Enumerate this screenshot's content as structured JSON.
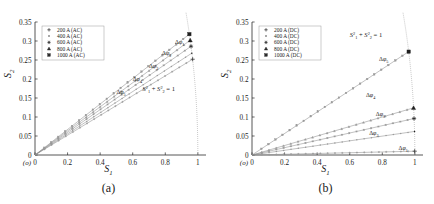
{
  "figure": {
    "panels": [
      {
        "id": "a",
        "caption": "(a)",
        "origin_label": "(o)",
        "xlabel": "S1",
        "ylabel": "S2",
        "circle_annotation": "S1^2 + S2^2 = 1",
        "legend": [
          {
            "label": "200 A (AC)",
            "marker": "plus"
          },
          {
            "label": "400 A (AC)",
            "marker": "dot"
          },
          {
            "label": "600 A (AC)",
            "marker": "star"
          },
          {
            "label": "800 A (AC)",
            "marker": "tri"
          },
          {
            "label": "1000 A (AC)",
            "marker": "square"
          }
        ],
        "phase_labels": [
          "d1",
          "d2",
          "d3",
          "d4",
          "d5"
        ]
      },
      {
        "id": "b",
        "caption": "(b)",
        "origin_label": "(o)",
        "xlabel": "S1",
        "ylabel": "S2",
        "circle_annotation": "S1^2 + S2^2 = 1",
        "legend": [
          {
            "label": "200 A (DC)",
            "marker": "plus"
          },
          {
            "label": "400 A (DC)",
            "marker": "dot"
          },
          {
            "label": "600 A (DC)",
            "marker": "star"
          },
          {
            "label": "800 A (DC)",
            "marker": "tri"
          },
          {
            "label": "1000 A (DC)",
            "marker": "square"
          }
        ],
        "phase_labels": [
          "d1",
          "d2",
          "d3",
          "d4",
          "d5"
        ]
      }
    ]
  },
  "chart_data": [
    {
      "type": "scatter",
      "panel": "a",
      "title": "",
      "xlabel": "S₁",
      "ylabel": "S₂",
      "xlim": [
        0,
        1.05
      ],
      "ylim": [
        0,
        0.35
      ],
      "xticks": [
        0,
        0.2,
        0.4,
        0.6,
        0.8,
        1
      ],
      "xticklabels": [
        "0",
        "0.2",
        "0.4",
        "0.6",
        "0.8",
        "1"
      ],
      "yticks": [
        0,
        0.05,
        0.1,
        0.15,
        0.2,
        0.25,
        0.3,
        0.35
      ],
      "yticklabels": [
        "0",
        "0.05",
        "0.1",
        "0.15",
        "0.2",
        "0.25",
        "0.3",
        "0.35"
      ],
      "grid": false,
      "legend_position": "upper-left",
      "annotations": [
        {
          "text": "S₁² + S₂² = 1",
          "x": 0.66,
          "y": 0.168
        },
        {
          "text": "Δφ₁",
          "x": 0.86,
          "y": 0.292
        },
        {
          "text": "Δφ₂",
          "x": 0.78,
          "y": 0.262
        },
        {
          "text": "Δφ₃",
          "x": 0.7,
          "y": 0.228
        },
        {
          "text": "Δφ₄",
          "x": 0.6,
          "y": 0.196
        },
        {
          "text": "Δφ₅",
          "x": 0.5,
          "y": 0.16
        }
      ],
      "arc": {
        "label": "unit circle",
        "radius": 1,
        "theta_deg": [
          14,
          19
        ]
      },
      "series": [
        {
          "name": "200 A (AC)",
          "marker": "plus",
          "endpoint": [
            0.968,
            0.252
          ]
        },
        {
          "name": "400 A (AC)",
          "marker": "dot",
          "endpoint": [
            0.963,
            0.268
          ]
        },
        {
          "name": "600 A (AC)",
          "marker": "star",
          "endpoint": [
            0.958,
            0.286
          ]
        },
        {
          "name": "800 A (AC)",
          "marker": "tri",
          "endpoint": [
            0.953,
            0.302
          ]
        },
        {
          "name": "1000 A (AC)",
          "marker": "square",
          "endpoint": [
            0.948,
            0.318
          ]
        }
      ]
    },
    {
      "type": "scatter",
      "panel": "b",
      "title": "",
      "xlabel": "S₁",
      "ylabel": "S₂",
      "xlim": [
        0,
        1.05
      ],
      "ylim": [
        0,
        0.35
      ],
      "xticks": [
        0,
        0.2,
        0.4,
        0.6,
        0.8,
        1
      ],
      "xticklabels": [
        "0",
        "0.2",
        "0.4",
        "0.6",
        "0.8",
        "1"
      ],
      "yticks": [
        0,
        0.05,
        0.1,
        0.15,
        0.2,
        0.25,
        0.3,
        0.35
      ],
      "yticklabels": [
        "0",
        "0.05",
        "0.1",
        "0.15",
        "0.2",
        "0.25",
        "0.3",
        "0.35"
      ],
      "grid": false,
      "legend_position": "upper-left",
      "annotations": [
        {
          "text": "S₁² + S₂² = 1",
          "x": 0.6,
          "y": 0.31
        },
        {
          "text": "Δφ₅",
          "x": 0.78,
          "y": 0.248
        },
        {
          "text": "Δφ₄",
          "x": 0.7,
          "y": 0.152
        },
        {
          "text": "Δφ₃",
          "x": 0.76,
          "y": 0.103
        },
        {
          "text": "Δφ₂",
          "x": 0.72,
          "y": 0.052
        },
        {
          "text": "Δφ₁",
          "x": 0.9,
          "y": 0.013
        }
      ],
      "arc": {
        "label": "unit circle",
        "radius": 1,
        "theta_deg": [
          0.5,
          20
        ]
      },
      "series": [
        {
          "name": "200 A (DC)",
          "marker": "plus",
          "endpoint": [
            0.999,
            0.01
          ]
        },
        {
          "name": "400 A (DC)",
          "marker": "dot",
          "endpoint": [
            0.998,
            0.062
          ]
        },
        {
          "name": "600 A (DC)",
          "marker": "star",
          "endpoint": [
            0.995,
            0.096
          ]
        },
        {
          "name": "800 A (DC)",
          "marker": "tri",
          "endpoint": [
            0.992,
            0.124
          ]
        },
        {
          "name": "1000 A (DC)",
          "marker": "square",
          "endpoint": [
            0.962,
            0.272
          ]
        }
      ]
    }
  ]
}
